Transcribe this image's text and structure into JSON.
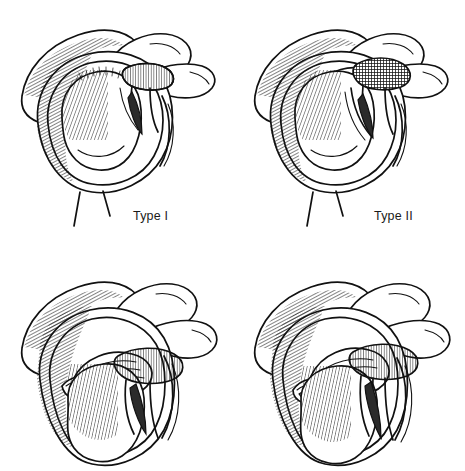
{
  "figure": {
    "kind": "anatomical-line-illustration",
    "background_color": "#ffffff",
    "ink_color": "#111111",
    "label_color": "#1a1a1a",
    "grid": {
      "rows": 2,
      "columns": 2
    },
    "view": "lateral glenoid view of the right shoulder",
    "bottom_row_cropped": true
  },
  "panels": [
    {
      "id": "type-1",
      "position": "top-left",
      "label": "Type I",
      "label_visible": true,
      "structures": [
        "acromion",
        "coracoid process",
        "glenoid fossa",
        "glenoid labrum",
        "biceps tendon",
        "long head of biceps anchor"
      ]
    },
    {
      "id": "type-2",
      "position": "top-right",
      "label": "Type II",
      "label_visible": true,
      "structures": [
        "acromion",
        "coracoid process",
        "glenoid fossa",
        "detached superior labrum",
        "biceps tendon",
        "biceps anchor detachment"
      ]
    },
    {
      "id": "type-3",
      "position": "bottom-left",
      "label": "",
      "label_visible": false,
      "structures": [
        "acromion",
        "coracoid process",
        "glenoid fossa",
        "bucket-handle labral tear",
        "displaced labral fragment",
        "biceps tendon"
      ]
    },
    {
      "id": "type-4",
      "position": "bottom-right",
      "label": "",
      "label_visible": false,
      "structures": [
        "acromion",
        "coracoid process",
        "glenoid fossa",
        "bucket-handle labral tear",
        "tear extending into biceps tendon",
        "biceps tendon"
      ]
    }
  ]
}
